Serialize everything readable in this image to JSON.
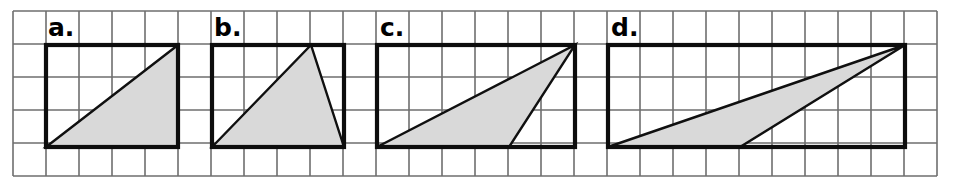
{
  "figure": {
    "background_color": "#ffffff",
    "grid": {
      "line_color": "#6e6e6e",
      "cell_size": 33,
      "origin_x": 13,
      "origin_y": 11,
      "columns": 28,
      "rows": 5
    },
    "style": {
      "box_stroke_color": "#0d0d0d",
      "triangle_fill_color": "#d9d9d9",
      "triangle_stroke_color": "#101010"
    },
    "panels": [
      {
        "label": "a.",
        "label_x": 48,
        "label_y": 36,
        "box": {
          "x": 46,
          "y": 45,
          "width": 132,
          "height": 102,
          "cells_wide": 4,
          "cells_tall": 3
        },
        "triangle": {
          "points": "46,147 178,45 178,147",
          "vertices": [
            {
              "x": 46,
              "y": 147
            },
            {
              "x": 178,
              "y": 45
            },
            {
              "x": 178,
              "y": 147
            }
          ],
          "base_cells": 4,
          "height_cells": 3,
          "kind": "right-triangle"
        }
      },
      {
        "label": "b.",
        "label_x": 214,
        "label_y": 36,
        "box": {
          "x": 212,
          "y": 45,
          "width": 132,
          "height": 102,
          "cells_wide": 4,
          "cells_tall": 3
        },
        "triangle": {
          "points": "212,147 311,45 344,147",
          "vertices": [
            {
              "x": 212,
              "y": 147
            },
            {
              "x": 311,
              "y": 45
            },
            {
              "x": 344,
              "y": 147
            }
          ],
          "base_cells": 4,
          "height_cells": 3,
          "kind": "acute-triangle"
        }
      },
      {
        "label": "c.",
        "label_x": 380,
        "label_y": 36,
        "box": {
          "x": 377,
          "y": 45,
          "width": 198,
          "height": 102,
          "cells_wide": 6,
          "cells_tall": 3
        },
        "triangle": {
          "points": "377,147 575,45 509,147",
          "vertices": [
            {
              "x": 377,
              "y": 147
            },
            {
              "x": 575,
              "y": 45
            },
            {
              "x": 509,
              "y": 147
            }
          ],
          "base_cells": 4,
          "height_cells": 3,
          "kind": "obtuse-triangle"
        }
      },
      {
        "label": "d.",
        "label_x": 611,
        "label_y": 36,
        "box": {
          "x": 608,
          "y": 45,
          "width": 297,
          "height": 102,
          "cells_wide": 9,
          "cells_tall": 3
        },
        "triangle": {
          "points": "608,147 905,45 740,147",
          "vertices": [
            {
              "x": 608,
              "y": 147
            },
            {
              "x": 905,
              "y": 45
            },
            {
              "x": 740,
              "y": 147
            }
          ],
          "base_cells": 4,
          "height_cells": 3,
          "kind": "obtuse-triangle"
        }
      }
    ]
  }
}
